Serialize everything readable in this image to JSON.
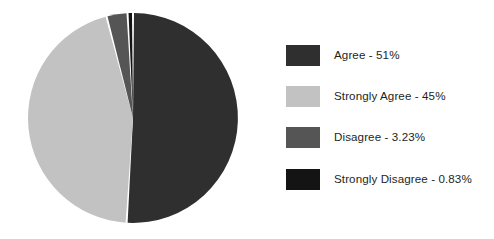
{
  "chart_data": {
    "type": "pie",
    "title": "",
    "categories": [
      "Agree",
      "Strongly Agree",
      "Disagree",
      "Strongly Disagree"
    ],
    "values": [
      51,
      45,
      3.23,
      0.83
    ],
    "value_labels": [
      "51%",
      "45%",
      "3.23%",
      "0.83%"
    ],
    "colors": [
      "#2f2f2f",
      "#c2c2c2",
      "#555555",
      "#141414"
    ],
    "legend_position": "right",
    "grid": false,
    "slice_gap": true,
    "start_angle_deg": 0,
    "direction": "clockwise"
  },
  "legend": {
    "items": [
      {
        "label": "Agree - 51%",
        "name": "Agree",
        "value": 51,
        "value_label": "51%",
        "color": "#2f2f2f"
      },
      {
        "label": "Strongly Agree - 45%",
        "name": "Strongly Agree",
        "value": 45,
        "value_label": "45%",
        "color": "#c2c2c2"
      },
      {
        "label": "Disagree - 3.23%",
        "name": "Disagree",
        "value": 3.23,
        "value_label": "3.23%",
        "color": "#555555"
      },
      {
        "label": "Strongly Disagree - 0.83%",
        "name": "Strongly Disagree",
        "value": 0.83,
        "value_label": "0.83%",
        "color": "#141414"
      }
    ]
  },
  "canvas": {
    "background": "#ffffff",
    "pie_center_x": 133,
    "pie_center_y": 118,
    "pie_radius": 105
  }
}
